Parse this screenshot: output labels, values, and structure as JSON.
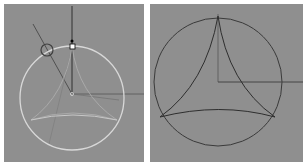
{
  "viewports": {
    "left": {
      "label": "construction-view",
      "bg": "#8f8f8f",
      "circle_color": "#d8d8d8",
      "line_color": "#5a5a5a"
    },
    "right": {
      "label": "result-view",
      "bg": "#8f8f8f",
      "stroke_color": "#3a3a3a"
    }
  }
}
